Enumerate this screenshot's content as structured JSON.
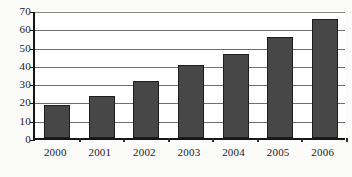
{
  "chart_data": {
    "type": "bar",
    "title": "",
    "xlabel": "",
    "ylabel": "",
    "categories": [
      "2000",
      "2001",
      "2002",
      "2003",
      "2004",
      "2005",
      "2006"
    ],
    "values": [
      18,
      23,
      31,
      40,
      46,
      55,
      65
    ],
    "series": [
      {
        "name": "",
        "values": [
          18,
          23,
          31,
          40,
          46,
          55,
          65
        ]
      }
    ],
    "ylim": [
      0,
      70
    ],
    "yticks": [
      0,
      10,
      20,
      30,
      40,
      50,
      60,
      70
    ],
    "ytick_labels": [
      "0",
      "10",
      "20",
      "30",
      "40",
      "50",
      "60",
      "70"
    ],
    "grid": true,
    "grid_axis": "y",
    "legend": false,
    "legend_position": "none",
    "bar_color": "#474747",
    "bar_edge_color": "#1d1d1d",
    "axis_color": "#161616",
    "gridline_color": "#6e6e6e",
    "background_color": "#ffffff"
  }
}
